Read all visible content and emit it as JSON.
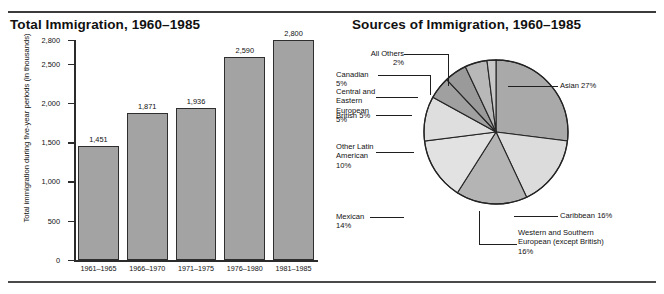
{
  "bar_panel": {
    "title": "Total Immigration, 1960–1985",
    "ylabel": "Total immigration during five-year periods (in thousands)"
  },
  "pie_panel": {
    "title": "Sources of Immigration, 1960–1985"
  },
  "chart_data": [
    {
      "type": "bar",
      "title": "Total Immigration, 1960–1985",
      "xlabel": "",
      "ylabel": "Total immigration during five-year periods (in thousands)",
      "categories": [
        "1961–1965",
        "1966–1970",
        "1971–1975",
        "1976–1980",
        "1981–1985"
      ],
      "values": [
        1451,
        1871,
        1936,
        2590,
        2800
      ],
      "value_labels": [
        "1,451",
        "1,871",
        "1,936",
        "2,590",
        "2,800"
      ],
      "ytick_values": [
        0,
        500,
        1000,
        1500,
        2000,
        2500,
        2800
      ],
      "ytick_labels": [
        "0",
        "500",
        "1,000",
        "1,500",
        "2,000",
        "2,500",
        "2,800"
      ],
      "ylim": [
        0,
        2800
      ],
      "grid": false,
      "legend": "none",
      "bar_color": "#a3a3a3",
      "bar_edge_color": "#2e2e2e"
    },
    {
      "type": "pie",
      "title": "Sources of Immigration, 1960–1985",
      "legend": "none",
      "labels": [
        "Asian 27%",
        "Caribbean 16%",
        "Western and Southern European (except British) 16%",
        "Mexican 14%",
        "Other Latin American 10%",
        "British 5%",
        "Central and Eastern European 5%",
        "Canadian 5%",
        "All Others 2%"
      ],
      "slices": [
        {
          "name": "Asian",
          "label": "Asian 27%",
          "value": 27,
          "color": "#a9a9a9"
        },
        {
          "name": "Caribbean",
          "label": "Caribbean 16%",
          "value": 16,
          "color": "#dcdcdc"
        },
        {
          "name": "WesternSouthernEuropean",
          "label": "Western and Southern European (except British) 16%",
          "value": 16,
          "color": "#b4b4b4"
        },
        {
          "name": "Mexican",
          "label": "Mexican 14%",
          "value": 14,
          "color": "#e2e2e2"
        },
        {
          "name": "OtherLatinAmerican",
          "label": "Other Latin American 10%",
          "value": 10,
          "color": "#dedede"
        },
        {
          "name": "British",
          "label": "British 5%",
          "value": 5,
          "color": "#a0a0a0"
        },
        {
          "name": "CentralEasternEuropean",
          "label": "Central and Eastern European 5%",
          "value": 5,
          "color": "#9a9a9a"
        },
        {
          "name": "Canadian",
          "label": "Canadian 5%",
          "value": 5,
          "color": "#b8b8b8"
        },
        {
          "name": "AllOthers",
          "label": "All Others 2%",
          "value": 2,
          "color": "#c8c8c8"
        }
      ],
      "callouts": {
        "all_others": "All Others 2%",
        "canadian": "Canadian 5%",
        "central_eastern_european_l1": "Central and",
        "central_eastern_european_l2": "Eastern European",
        "central_eastern_european_l3": "5%",
        "british": "British 5%",
        "other_latin_american_l1": "Other Latin",
        "other_latin_american_l2": "American",
        "other_latin_american_l3": "10%",
        "mexican": "Mexican 14%",
        "asian": "Asian 27%",
        "caribbean": "Caribbean 16%",
        "west_south_euro_l1": "Western and Southern",
        "west_south_euro_l2": "European (except British)",
        "west_south_euro_l3": "16%"
      }
    }
  ]
}
